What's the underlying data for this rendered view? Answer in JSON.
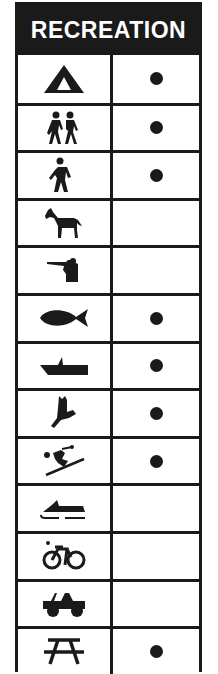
{
  "header": {
    "title": "RECREATION"
  },
  "rows": [
    {
      "activity": "camping",
      "icon": "tent-icon",
      "available": true
    },
    {
      "activity": "hiking",
      "icon": "hikers-icon",
      "available": true
    },
    {
      "activity": "walking",
      "icon": "hiker-icon",
      "available": true
    },
    {
      "activity": "horseback-riding",
      "icon": "horse-icon",
      "available": false
    },
    {
      "activity": "hunting",
      "icon": "hunter-icon",
      "available": false
    },
    {
      "activity": "fishing",
      "icon": "fish-icon",
      "available": true
    },
    {
      "activity": "boating",
      "icon": "boat-icon",
      "available": true
    },
    {
      "activity": "wildlife-viewing",
      "icon": "bird-icon",
      "available": true
    },
    {
      "activity": "skiing",
      "icon": "skier-icon",
      "available": true
    },
    {
      "activity": "snowmobiling",
      "icon": "snowmobile-icon",
      "available": false
    },
    {
      "activity": "bicycling",
      "icon": "bicycle-icon",
      "available": false
    },
    {
      "activity": "off-road-vehicles",
      "icon": "jeep-icon",
      "available": false
    },
    {
      "activity": "picnicking",
      "icon": "picnic-table-icon",
      "available": true
    }
  ]
}
